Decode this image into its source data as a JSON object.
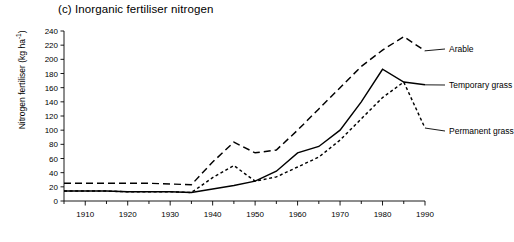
{
  "figure": {
    "panel_label": "(c)",
    "title": "(c)  Inorganic fertiliser nitrogen",
    "title_text": "Inorganic fertiliser nitrogen",
    "y_axis_label_text": "Nitrogen fertiliser (kg ha",
    "y_axis_label_sup": "-1",
    "y_axis_label_close": ")",
    "y_axis_label_full": "Nitrogen fertiliser (kg ha-1)"
  },
  "chart_data": {
    "type": "line",
    "title": "(c)  Inorganic fertiliser nitrogen",
    "xlabel": "",
    "ylabel": "Nitrogen fertiliser (kg ha-1)",
    "xlim": [
      1905,
      1990
    ],
    "ylim": [
      0,
      240
    ],
    "grid": false,
    "legend_position": "right-of-plot-inline",
    "x_ticks_major": [
      1910,
      1920,
      1930,
      1940,
      1950,
      1960,
      1970,
      1980,
      1990
    ],
    "x_ticks_minor": [
      1905,
      1915,
      1925,
      1935,
      1945,
      1955,
      1965,
      1975,
      1985
    ],
    "x_tick_labels": [
      "1910",
      "1920",
      "1930",
      "1940",
      "1950",
      "1960",
      "1970",
      "1980",
      "1990"
    ],
    "y_ticks": [
      0,
      20,
      40,
      60,
      80,
      100,
      120,
      140,
      160,
      180,
      200,
      220,
      240
    ],
    "y_tick_labels": [
      "0",
      "20",
      "40",
      "60",
      "80",
      "100",
      "120",
      "140",
      "160",
      "180",
      "200",
      "220",
      "240"
    ],
    "series": [
      {
        "name": "Arable",
        "label": "Arable",
        "style": "long-dashed",
        "color": "#000000",
        "x": [
          1905,
          1910,
          1915,
          1920,
          1925,
          1930,
          1935,
          1940,
          1945,
          1950,
          1955,
          1960,
          1965,
          1970,
          1975,
          1980,
          1985,
          1990
        ],
        "values": [
          25,
          25,
          25,
          25,
          25,
          24,
          23,
          55,
          83,
          68,
          72,
          100,
          130,
          160,
          190,
          213,
          232,
          212
        ]
      },
      {
        "name": "Temporary grass",
        "label": "Temporary grass",
        "style": "solid",
        "color": "#000000",
        "x": [
          1905,
          1910,
          1915,
          1920,
          1925,
          1930,
          1935,
          1940,
          1945,
          1950,
          1955,
          1960,
          1965,
          1970,
          1975,
          1980,
          1985,
          1990
        ],
        "values": [
          14,
          14,
          14,
          13,
          13,
          13,
          12,
          17,
          22,
          28,
          42,
          68,
          77,
          100,
          140,
          186,
          168,
          164
        ]
      },
      {
        "name": "Permanent grass",
        "label": "Permanent grass",
        "style": "short-dashed",
        "color": "#000000",
        "x": [
          1905,
          1910,
          1915,
          1920,
          1925,
          1930,
          1935,
          1940,
          1945,
          1950,
          1955,
          1960,
          1965,
          1970,
          1975,
          1980,
          1985,
          1990
        ],
        "values": [
          14,
          14,
          14,
          13,
          13,
          13,
          12,
          33,
          50,
          28,
          34,
          48,
          62,
          86,
          116,
          146,
          168,
          103
        ]
      }
    ]
  }
}
